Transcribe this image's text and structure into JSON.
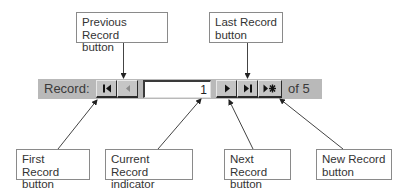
{
  "toolbar": {
    "record_label": "Record:",
    "current_record": "1",
    "of_label": "of 5",
    "background": "#b9b9b9",
    "buttons": [
      {
        "name": "first-record-button",
        "icon": "first-record-icon",
        "enabled": true
      },
      {
        "name": "previous-record-button",
        "icon": "previous-record-icon",
        "enabled": false
      },
      {
        "name": "next-record-button",
        "icon": "next-record-icon",
        "enabled": true
      },
      {
        "name": "last-record-button",
        "icon": "last-record-icon",
        "enabled": true
      },
      {
        "name": "new-record-button",
        "icon": "new-record-icon",
        "enabled": true
      }
    ]
  },
  "callouts": {
    "previous": {
      "line1": "Previous Record",
      "line2": "button"
    },
    "last": {
      "line1": "Last Record",
      "line2": "button"
    },
    "first": {
      "line1": "First Record",
      "line2": "button"
    },
    "current": {
      "line1": "Current Record",
      "line2": "indicator"
    },
    "next": {
      "line1": "Next Record",
      "line2": "button"
    },
    "new": {
      "line1": "New Record",
      "line2": "button"
    }
  }
}
